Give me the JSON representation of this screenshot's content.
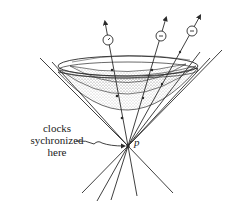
{
  "diagram": {
    "labels": {
      "clocks_line1": "clocks",
      "clocks_line2": "sychronized",
      "clocks_line3": "here",
      "event": "p"
    },
    "colors": {
      "ink": "#2a2a2a",
      "stipple": "#888888",
      "background": "#ffffff"
    },
    "elements": {
      "light_cone": "future light cone opening upward from event p",
      "worldlines": 3,
      "clocks": 3,
      "hyperboloids": 3
    }
  }
}
